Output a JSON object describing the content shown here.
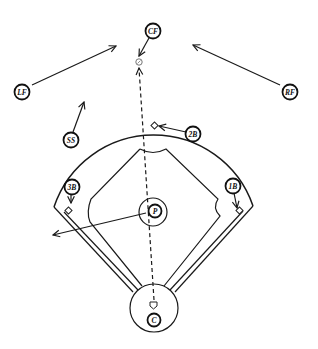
{
  "diagram": {
    "type": "baseball-defensive-positioning",
    "colors": {
      "ink": "#1a1a1a",
      "background": "#ffffff"
    },
    "players": [
      {
        "id": "cf",
        "label": "CF",
        "x": 153,
        "y": 31
      },
      {
        "id": "lf",
        "label": "LF",
        "x": 22,
        "y": 92
      },
      {
        "id": "rf",
        "label": "RF",
        "x": 290,
        "y": 92
      },
      {
        "id": "ss",
        "label": "SS",
        "x": 71,
        "y": 140
      },
      {
        "id": "2b",
        "label": "2B",
        "x": 193,
        "y": 134
      },
      {
        "id": "3b",
        "label": "3B",
        "x": 72,
        "y": 187
      },
      {
        "id": "1b",
        "label": "1B",
        "x": 233,
        "y": 186
      },
      {
        "id": "p",
        "label": "P",
        "x": 155,
        "y": 211
      },
      {
        "id": "c",
        "label": "C",
        "x": 154,
        "y": 320
      }
    ],
    "movements": [
      {
        "from": "cf",
        "to": [
          139,
          57
        ]
      },
      {
        "from": "lf",
        "to": [
          116,
          46
        ]
      },
      {
        "from": "rf",
        "to": [
          193,
          45
        ]
      },
      {
        "from": "ss",
        "to": [
          83,
          101
        ]
      },
      {
        "from": "2b",
        "to": [
          159,
          126
        ]
      },
      {
        "from": "3b",
        "to": [
          71,
          203
        ]
      },
      {
        "from": "1b",
        "to": [
          237,
          209
        ]
      },
      {
        "from": "p",
        "to": [
          53,
          235
        ]
      }
    ],
    "ball_path": {
      "from": [
        154,
        304
      ],
      "to": [
        139,
        66
      ],
      "style": "dashed"
    },
    "ball_marker": {
      "x": 139,
      "y": 62
    },
    "bases": [
      "first",
      "second",
      "third",
      "home"
    ]
  }
}
